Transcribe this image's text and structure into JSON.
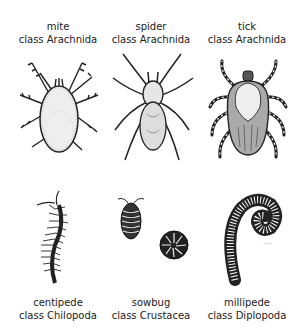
{
  "figure": {
    "animals": [
      {
        "common_name": "mite",
        "class_label": "class Arachnida",
        "illustration": "mite-illustration"
      },
      {
        "common_name": "spider",
        "class_label": "class Arachnida",
        "illustration": "spider-illustration"
      },
      {
        "common_name": "tick",
        "class_label": "class Arachnida",
        "illustration": "tick-illustration"
      },
      {
        "common_name": "centipede",
        "class_label": "class Chilopoda",
        "illustration": "centipede-illustration"
      },
      {
        "common_name": "sowbug",
        "class_label": "class Crustacea",
        "illustration": "sowbug-illustration"
      },
      {
        "common_name": "millipede",
        "class_label": "class Diplopoda",
        "illustration": "millipede-illustration"
      }
    ]
  }
}
